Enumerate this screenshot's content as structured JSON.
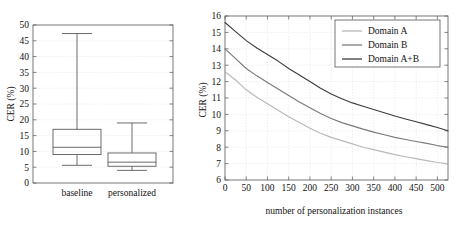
{
  "figure": {
    "name": "CER comparison figure",
    "panels": [
      "boxplot",
      "lineplot"
    ]
  },
  "chart_data": [
    {
      "type": "bar",
      "subtype": "boxplot",
      "title": "",
      "xlabel": "",
      "ylabel": "CER (%)",
      "ylim": [
        0,
        50
      ],
      "yticks": [
        0,
        5,
        10,
        15,
        20,
        25,
        30,
        35,
        40,
        45,
        50
      ],
      "ytick_labels": [
        "0",
        "5",
        "10",
        "15",
        "20",
        "25",
        "30",
        "35",
        "40",
        "45",
        "50"
      ],
      "grid": true,
      "categories": [
        "baseline",
        "personalized"
      ],
      "boxes": [
        {
          "category": "baseline",
          "whisker_low": 5.6,
          "q1": 9.0,
          "median": 11.3,
          "q3": 17.0,
          "whisker_high": 47.3
        },
        {
          "category": "personalized",
          "whisker_low": 4.0,
          "q1": 5.3,
          "median": 6.6,
          "q3": 9.5,
          "whisker_high": 19.0
        }
      ]
    },
    {
      "type": "line",
      "title": "",
      "xlabel": "number of personalization instances",
      "ylabel": "CER (%)",
      "xlim": [
        0,
        525
      ],
      "ylim": [
        6,
        16
      ],
      "xticks": [
        0,
        50,
        100,
        150,
        200,
        250,
        300,
        350,
        400,
        450,
        500
      ],
      "xtick_labels": [
        "0",
        "50",
        "100",
        "150",
        "200",
        "250",
        "300",
        "350",
        "400",
        "450",
        "500"
      ],
      "yticks": [
        6,
        7,
        8,
        9,
        10,
        11,
        12,
        13,
        14,
        15,
        16
      ],
      "ytick_labels": [
        "6",
        "7",
        "8",
        "9",
        "10",
        "11",
        "12",
        "13",
        "14",
        "15",
        "16"
      ],
      "grid": true,
      "legend_position": "top-right",
      "x": [
        0,
        25,
        50,
        75,
        100,
        125,
        150,
        175,
        200,
        225,
        250,
        275,
        300,
        325,
        350,
        375,
        400,
        425,
        450,
        475,
        500,
        525
      ],
      "series": [
        {
          "name": "Domain A",
          "color": "#b9b9b9",
          "values": [
            12.6,
            12.1,
            11.5,
            11.05,
            10.65,
            10.25,
            9.85,
            9.5,
            9.15,
            8.85,
            8.6,
            8.4,
            8.2,
            8.0,
            7.85,
            7.7,
            7.55,
            7.42,
            7.3,
            7.18,
            7.07,
            6.98
          ]
        },
        {
          "name": "Domain B",
          "color": "#7a7a7a",
          "values": [
            14.0,
            13.4,
            12.8,
            12.35,
            11.95,
            11.55,
            11.15,
            10.75,
            10.4,
            10.05,
            9.75,
            9.5,
            9.3,
            9.1,
            8.92,
            8.76,
            8.6,
            8.47,
            8.35,
            8.23,
            8.1,
            8.0
          ]
        },
        {
          "name": "Domain A+B",
          "color": "#3d3d3d",
          "values": [
            15.6,
            15.05,
            14.5,
            14.05,
            13.65,
            13.25,
            12.8,
            12.4,
            12.0,
            11.6,
            11.25,
            10.95,
            10.7,
            10.5,
            10.3,
            10.1,
            9.9,
            9.72,
            9.55,
            9.38,
            9.2,
            9.0
          ]
        }
      ],
      "legend_entries": [
        "Domain A",
        "Domain B",
        "Domain A+B"
      ]
    }
  ],
  "boxplot": {
    "y_axis_label": "CER (%)",
    "y_tick_labels": [
      "0",
      "5",
      "10",
      "15",
      "20",
      "25",
      "30",
      "35",
      "40",
      "45",
      "50"
    ],
    "category_labels": [
      "baseline",
      "personalized"
    ]
  },
  "lineplot": {
    "y_axis_label": "CER (%)",
    "x_axis_label": "number of personalization instances",
    "y_tick_labels": [
      "6",
      "7",
      "8",
      "9",
      "10",
      "11",
      "12",
      "13",
      "14",
      "15",
      "16"
    ],
    "x_tick_labels": [
      "0",
      "50",
      "100",
      "150",
      "200",
      "250",
      "300",
      "350",
      "400",
      "450",
      "500"
    ],
    "legend": [
      {
        "label": "Domain A",
        "color": "#b9b9b9"
      },
      {
        "label": "Domain B",
        "color": "#7a7a7a"
      },
      {
        "label": "Domain A+B",
        "color": "#3d3d3d"
      }
    ]
  }
}
